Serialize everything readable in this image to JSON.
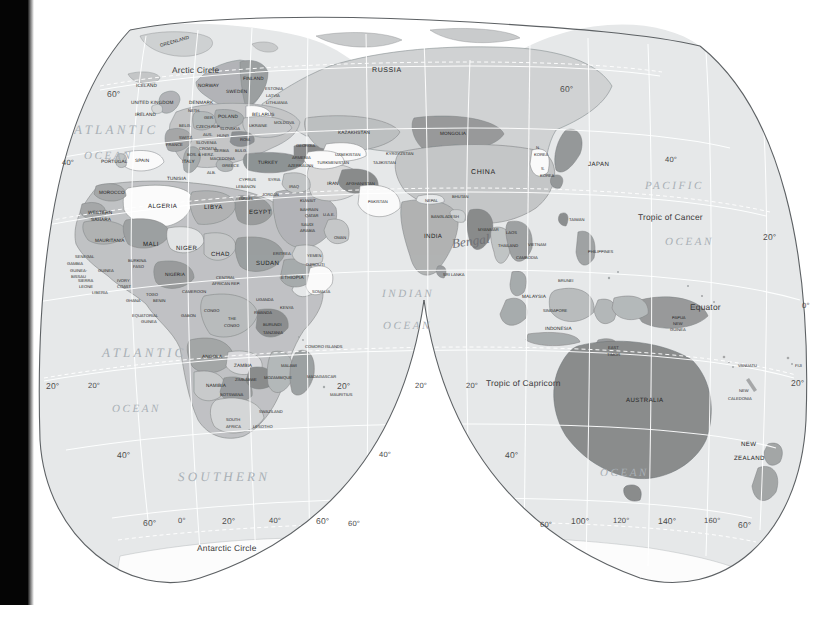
{
  "document": {
    "type": "world-map",
    "projection": "interrupted-goode-homolosine-lobes",
    "coverage": "Eastern Hemisphere: Europe, Africa, Asia, Australia, Oceania",
    "style": "greyscale political reference map"
  },
  "colors": {
    "background": "#ffffff",
    "ocean": "#e4e6e7",
    "land_light": "#d3d5d6",
    "land_mid": "#b6b9ba",
    "land_dark": "#9a9d9e",
    "land_darkest": "#808384",
    "land_white": "#fbfbfb",
    "graticule": "#ffffff",
    "outline": "#5d6164",
    "label": "#232323",
    "ocean_label": "#a9b0b6",
    "scan_edge": "#050505"
  },
  "oceans": [
    {
      "name": "ATLANTIC",
      "x": 74,
      "y": 122
    },
    {
      "name": "OCEAN",
      "x": 84,
      "y": 150
    },
    {
      "name": "ATLANTIC",
      "x": 102,
      "y": 345
    },
    {
      "name": "OCEAN",
      "x": 112,
      "y": 403
    },
    {
      "name": "SOUTHERN",
      "x": 178,
      "y": 469
    },
    {
      "name": "INDIAN",
      "x": 382,
      "y": 288
    },
    {
      "name": "OCEAN",
      "x": 383,
      "y": 320
    },
    {
      "name": "PACIFIC",
      "x": 645,
      "y": 180
    },
    {
      "name": "OCEAN",
      "x": 665,
      "y": 236
    },
    {
      "name": "OCEAN",
      "x": 600,
      "y": 467
    }
  ],
  "special_lines": [
    {
      "label": "Arctic Circle",
      "x": 172,
      "y": 65
    },
    {
      "label": "Antarctic Circle",
      "x": 197,
      "y": 543
    },
    {
      "label": "Tropic of Cancer",
      "x": 638,
      "y": 212
    },
    {
      "label": "Tropic of Capricorn",
      "x": 486,
      "y": 378
    },
    {
      "label": "Equator",
      "x": 690,
      "y": 302
    }
  ],
  "graticule_labels": [
    {
      "label": "60°",
      "x": 107,
      "y": 89
    },
    {
      "label": "40°",
      "x": 62,
      "y": 158
    },
    {
      "label": "20°",
      "x": 46,
      "y": 381
    },
    {
      "label": "20°",
      "x": 88,
      "y": 381
    },
    {
      "label": "40°",
      "x": 117,
      "y": 450
    },
    {
      "label": "40°",
      "x": 379,
      "y": 450
    },
    {
      "label": "60°",
      "x": 143,
      "y": 518
    },
    {
      "label": "0°",
      "x": 178,
      "y": 516
    },
    {
      "label": "20°",
      "x": 222,
      "y": 516
    },
    {
      "label": "40°",
      "x": 269,
      "y": 516
    },
    {
      "label": "60°",
      "x": 316,
      "y": 516
    },
    {
      "label": "60°",
      "x": 348,
      "y": 519
    },
    {
      "label": "20°",
      "x": 337,
      "y": 381
    },
    {
      "label": "20°",
      "x": 415,
      "y": 381
    },
    {
      "label": "60°",
      "x": 560,
      "y": 84
    },
    {
      "label": "40°",
      "x": 665,
      "y": 155
    },
    {
      "label": "20°",
      "x": 763,
      "y": 232
    },
    {
      "label": "0°",
      "x": 802,
      "y": 301
    },
    {
      "label": "20°",
      "x": 791,
      "y": 378
    },
    {
      "label": "20°",
      "x": 466,
      "y": 381
    },
    {
      "label": "40°",
      "x": 505,
      "y": 450
    },
    {
      "label": "60°",
      "x": 540,
      "y": 520
    },
    {
      "label": "100°",
      "x": 571,
      "y": 516
    },
    {
      "label": "120°",
      "x": 613,
      "y": 516
    },
    {
      "label": "140°",
      "x": 658,
      "y": 516
    },
    {
      "label": "160°",
      "x": 704,
      "y": 516
    },
    {
      "label": "60°",
      "x": 738,
      "y": 520
    }
  ],
  "annotation": {
    "text": "Bengal",
    "x": 452,
    "y": 236
  },
  "countries": [
    {
      "n": "GREENLAND",
      "x": 160,
      "y": 43,
      "s": "sm",
      "r": "rot-l2"
    },
    {
      "n": "ICELAND",
      "x": 136,
      "y": 83,
      "s": "sm"
    },
    {
      "n": "NORWAY",
      "x": 198,
      "y": 83,
      "s": "sm"
    },
    {
      "n": "SWEDEN",
      "x": 226,
      "y": 89,
      "s": "sm"
    },
    {
      "n": "FINLAND",
      "x": 243,
      "y": 76,
      "s": "sm"
    },
    {
      "n": "ESTONIA",
      "x": 265,
      "y": 86,
      "s": "tiny"
    },
    {
      "n": "LATVIA",
      "x": 266,
      "y": 93,
      "s": "tiny"
    },
    {
      "n": "LITHUANIA",
      "x": 266,
      "y": 100,
      "s": "tiny"
    },
    {
      "n": "UNITED KINGDOM",
      "x": 131,
      "y": 100,
      "s": "sm"
    },
    {
      "n": "DENMARK",
      "x": 189,
      "y": 100,
      "s": "sm"
    },
    {
      "n": "IRELAND",
      "x": 135,
      "y": 112,
      "s": "sm"
    },
    {
      "n": "NETH.",
      "x": 188,
      "y": 108,
      "s": "tiny"
    },
    {
      "n": "GER.",
      "x": 204,
      "y": 115,
      "s": "tiny"
    },
    {
      "n": "POLAND",
      "x": 218,
      "y": 114,
      "s": "sm"
    },
    {
      "n": "BELARUS",
      "x": 252,
      "y": 112,
      "s": "sm"
    },
    {
      "n": "MOLDOVA",
      "x": 274,
      "y": 120,
      "s": "tiny"
    },
    {
      "n": "UKRAINE",
      "x": 249,
      "y": 123,
      "s": "tiny"
    },
    {
      "n": "BELG.",
      "x": 179,
      "y": 123,
      "s": "tiny"
    },
    {
      "n": "CZECH REP.",
      "x": 196,
      "y": 124,
      "s": "tiny"
    },
    {
      "n": "SLOVAKIA",
      "x": 220,
      "y": 126,
      "s": "tiny"
    },
    {
      "n": "SWITZ.",
      "x": 179,
      "y": 135,
      "s": "tiny"
    },
    {
      "n": "AUS.",
      "x": 203,
      "y": 132,
      "s": "tiny"
    },
    {
      "n": "HUNG.",
      "x": 217,
      "y": 133,
      "s": "tiny"
    },
    {
      "n": "FRANCE",
      "x": 166,
      "y": 142,
      "s": "tiny"
    },
    {
      "n": "SLOVENIA",
      "x": 196,
      "y": 140,
      "s": "tiny"
    },
    {
      "n": "CROATIA",
      "x": 199,
      "y": 146,
      "s": "tiny"
    },
    {
      "n": "ROM.",
      "x": 240,
      "y": 137,
      "s": "tiny"
    },
    {
      "n": "BOS. & HERZ.",
      "x": 187,
      "y": 152,
      "s": "tiny"
    },
    {
      "n": "SERBIA",
      "x": 214,
      "y": 148,
      "s": "tiny"
    },
    {
      "n": "BULG.",
      "x": 235,
      "y": 148,
      "s": "tiny"
    },
    {
      "n": "GEORGIA",
      "x": 296,
      "y": 143,
      "s": "tiny"
    },
    {
      "n": "PORTUGAL",
      "x": 101,
      "y": 159,
      "s": "sm"
    },
    {
      "n": "SPAIN",
      "x": 135,
      "y": 158,
      "s": "sm"
    },
    {
      "n": "ITALY",
      "x": 182,
      "y": 159,
      "s": "sm"
    },
    {
      "n": "MACEDONIA",
      "x": 210,
      "y": 156,
      "s": "tiny"
    },
    {
      "n": "GREECE",
      "x": 222,
      "y": 163,
      "s": "tiny"
    },
    {
      "n": "TURKEY",
      "x": 258,
      "y": 160,
      "s": "sm"
    },
    {
      "n": "ARMENIA",
      "x": 292,
      "y": 155,
      "s": "tiny"
    },
    {
      "n": "AZERBAIJAN",
      "x": 288,
      "y": 163,
      "s": "tiny"
    },
    {
      "n": "ALB.",
      "x": 207,
      "y": 170,
      "s": "tiny"
    },
    {
      "n": "TUNISIA",
      "x": 167,
      "y": 176,
      "s": "sm"
    },
    {
      "n": "CYPRUS",
      "x": 239,
      "y": 177,
      "s": "tiny"
    },
    {
      "n": "LEBANON",
      "x": 236,
      "y": 184,
      "s": "tiny"
    },
    {
      "n": "SYRIA",
      "x": 268,
      "y": 177,
      "s": "tiny"
    },
    {
      "n": "IRAQ",
      "x": 289,
      "y": 184,
      "s": "tiny"
    },
    {
      "n": "ISRAEL",
      "x": 239,
      "y": 196,
      "s": "tiny"
    },
    {
      "n": "JORDAN",
      "x": 262,
      "y": 192,
      "s": "tiny"
    },
    {
      "n": "MOROCCO",
      "x": 99,
      "y": 190,
      "s": "sm"
    },
    {
      "n": "ALGERIA",
      "x": 148,
      "y": 203,
      "s": "med"
    },
    {
      "n": "LIBYA",
      "x": 204,
      "y": 204,
      "s": "med"
    },
    {
      "n": "EGYPT",
      "x": 249,
      "y": 209,
      "s": "med"
    },
    {
      "n": "KUWAIT",
      "x": 300,
      "y": 198,
      "s": "tiny"
    },
    {
      "n": "BAHRAIN",
      "x": 300,
      "y": 207,
      "s": "tiny"
    },
    {
      "n": "QATAR",
      "x": 305,
      "y": 213,
      "s": "tiny"
    },
    {
      "n": "U.A.E.",
      "x": 323,
      "y": 212,
      "s": "tiny"
    },
    {
      "n": "SAUDI",
      "x": 301,
      "y": 222,
      "s": "tiny"
    },
    {
      "n": "ARABIA",
      "x": 300,
      "y": 228,
      "s": "tiny"
    },
    {
      "n": "OMAN",
      "x": 334,
      "y": 235,
      "s": "tiny"
    },
    {
      "n": "WESTERN",
      "x": 88,
      "y": 210,
      "s": "sm"
    },
    {
      "n": "SAHARA",
      "x": 91,
      "y": 217,
      "s": "sm"
    },
    {
      "n": "MAURITANIA",
      "x": 95,
      "y": 238,
      "s": "sm"
    },
    {
      "n": "MALI",
      "x": 143,
      "y": 241,
      "s": "med"
    },
    {
      "n": "NIGER",
      "x": 176,
      "y": 245,
      "s": "med"
    },
    {
      "n": "CHAD",
      "x": 211,
      "y": 251,
      "s": "med"
    },
    {
      "n": "SUDAN",
      "x": 256,
      "y": 260,
      "s": "med"
    },
    {
      "n": "ERITREA",
      "x": 273,
      "y": 251,
      "s": "tiny"
    },
    {
      "n": "YEMEN",
      "x": 307,
      "y": 253,
      "s": "tiny"
    },
    {
      "n": "DJIBOUTI",
      "x": 306,
      "y": 262,
      "s": "tiny"
    },
    {
      "n": "SENEGAL",
      "x": 75,
      "y": 254,
      "s": "tiny"
    },
    {
      "n": "GAMBIA",
      "x": 67,
      "y": 261,
      "s": "tiny"
    },
    {
      "n": "GUINEA-",
      "x": 70,
      "y": 268,
      "s": "tiny"
    },
    {
      "n": "BISSAU",
      "x": 71,
      "y": 274,
      "s": "tiny"
    },
    {
      "n": "GUINEA",
      "x": 98,
      "y": 268,
      "s": "tiny"
    },
    {
      "n": "BURKINA",
      "x": 128,
      "y": 258,
      "s": "tiny"
    },
    {
      "n": "FASO",
      "x": 133,
      "y": 264,
      "s": "tiny"
    },
    {
      "n": "SIERRA",
      "x": 78,
      "y": 278,
      "s": "tiny"
    },
    {
      "n": "LEONE",
      "x": 79,
      "y": 284,
      "s": "tiny"
    },
    {
      "n": "LIBERIA",
      "x": 92,
      "y": 290,
      "s": "tiny"
    },
    {
      "n": "IVORY",
      "x": 117,
      "y": 278,
      "s": "tiny"
    },
    {
      "n": "COAST",
      "x": 117,
      "y": 284,
      "s": "tiny"
    },
    {
      "n": "GHANA",
      "x": 126,
      "y": 298,
      "s": "tiny"
    },
    {
      "n": "TOGO",
      "x": 146,
      "y": 292,
      "s": "tiny"
    },
    {
      "n": "BENIN",
      "x": 153,
      "y": 298,
      "s": "tiny"
    },
    {
      "n": "NIGERIA",
      "x": 165,
      "y": 272,
      "s": "sm"
    },
    {
      "n": "CAMEROON",
      "x": 182,
      "y": 289,
      "s": "tiny"
    },
    {
      "n": "CENTRAL",
      "x": 216,
      "y": 275,
      "s": "tiny"
    },
    {
      "n": "AFRICAN REP.",
      "x": 212,
      "y": 281,
      "s": "tiny"
    },
    {
      "n": "ETHIOPIA",
      "x": 281,
      "y": 275,
      "s": "sm"
    },
    {
      "n": "SOMALIA",
      "x": 312,
      "y": 289,
      "s": "tiny"
    },
    {
      "n": "EQUATORIAL",
      "x": 132,
      "y": 313,
      "s": "tiny"
    },
    {
      "n": "GUINEA",
      "x": 141,
      "y": 319,
      "s": "tiny"
    },
    {
      "n": "GABON",
      "x": 181,
      "y": 313,
      "s": "tiny"
    },
    {
      "n": "CONGO",
      "x": 204,
      "y": 308,
      "s": "tiny"
    },
    {
      "n": "THE",
      "x": 228,
      "y": 316,
      "s": "tiny"
    },
    {
      "n": "CONGO",
      "x": 224,
      "y": 323,
      "s": "tiny"
    },
    {
      "n": "UGANDA",
      "x": 256,
      "y": 297,
      "s": "tiny"
    },
    {
      "n": "KENYA",
      "x": 280,
      "y": 305,
      "s": "tiny"
    },
    {
      "n": "RWANDA",
      "x": 254,
      "y": 310,
      "s": "tiny"
    },
    {
      "n": "BURUNDI",
      "x": 263,
      "y": 322,
      "s": "tiny"
    },
    {
      "n": "TANZANIA",
      "x": 263,
      "y": 330,
      "s": "tiny"
    },
    {
      "n": "COMORO ISLANDS",
      "x": 305,
      "y": 344,
      "s": "tiny"
    },
    {
      "n": "ANGOLA",
      "x": 202,
      "y": 354,
      "s": "sm"
    },
    {
      "n": "ZAMBIA",
      "x": 234,
      "y": 363,
      "s": "sm"
    },
    {
      "n": "MALAWI",
      "x": 281,
      "y": 363,
      "s": "tiny"
    },
    {
      "n": "MOZAMBIQUE",
      "x": 264,
      "y": 375,
      "s": "tiny"
    },
    {
      "n": "MADAGASCAR",
      "x": 307,
      "y": 374,
      "s": "tiny"
    },
    {
      "n": "NAMIBIA",
      "x": 206,
      "y": 383,
      "s": "sm"
    },
    {
      "n": "ZIMBABWE",
      "x": 235,
      "y": 377,
      "s": "tiny"
    },
    {
      "n": "BOTSWANA",
      "x": 220,
      "y": 392,
      "s": "tiny"
    },
    {
      "n": "MAURITIUS",
      "x": 330,
      "y": 392,
      "s": "tiny"
    },
    {
      "n": "SWAZILAND",
      "x": 259,
      "y": 409,
      "s": "tiny"
    },
    {
      "n": "SOUTH",
      "x": 226,
      "y": 417,
      "s": "tiny"
    },
    {
      "n": "AFRICA",
      "x": 226,
      "y": 424,
      "s": "tiny"
    },
    {
      "n": "LESOTHO",
      "x": 253,
      "y": 424,
      "s": "tiny"
    },
    {
      "n": "RUSSIA",
      "x": 372,
      "y": 67,
      "s": "big"
    },
    {
      "n": "KAZAKHSTAN",
      "x": 338,
      "y": 130,
      "s": "sm"
    },
    {
      "n": "MONGOLIA",
      "x": 440,
      "y": 131,
      "s": "sm"
    },
    {
      "n": "UZBEKISTAN",
      "x": 335,
      "y": 152,
      "s": "tiny"
    },
    {
      "n": "KYRGYZSTAN",
      "x": 386,
      "y": 151,
      "s": "tiny"
    },
    {
      "n": "TURKMENISTAN",
      "x": 317,
      "y": 160,
      "s": "tiny"
    },
    {
      "n": "TAJIKISTAN",
      "x": 373,
      "y": 160,
      "s": "tiny"
    },
    {
      "n": "CHINA",
      "x": 471,
      "y": 169,
      "s": "big"
    },
    {
      "n": "IRAN",
      "x": 327,
      "y": 181,
      "s": "sm"
    },
    {
      "n": "AFGHANISTAN",
      "x": 346,
      "y": 181,
      "s": "tiny"
    },
    {
      "n": "PAKISTAN",
      "x": 368,
      "y": 199,
      "s": "tiny"
    },
    {
      "n": "N.",
      "x": 536,
      "y": 145,
      "s": "tiny"
    },
    {
      "n": "KOREA",
      "x": 534,
      "y": 152,
      "s": "tiny"
    },
    {
      "n": "S.",
      "x": 541,
      "y": 166,
      "s": "tiny"
    },
    {
      "n": "KOREA",
      "x": 540,
      "y": 173,
      "s": "tiny"
    },
    {
      "n": "JAPAN",
      "x": 588,
      "y": 161,
      "s": "med"
    },
    {
      "n": "NEPAL",
      "x": 425,
      "y": 198,
      "s": "tiny"
    },
    {
      "n": "BHUTAN",
      "x": 452,
      "y": 194,
      "s": "tiny"
    },
    {
      "n": "BANGLADESH",
      "x": 431,
      "y": 214,
      "s": "tiny"
    },
    {
      "n": "INDIA",
      "x": 424,
      "y": 233,
      "s": "med"
    },
    {
      "n": "MYANMAR",
      "x": 478,
      "y": 227,
      "s": "tiny"
    },
    {
      "n": "LAOS",
      "x": 506,
      "y": 230,
      "s": "tiny"
    },
    {
      "n": "THAILAND",
      "x": 498,
      "y": 243,
      "s": "tiny"
    },
    {
      "n": "VIETNAM",
      "x": 528,
      "y": 242,
      "s": "tiny"
    },
    {
      "n": "CAMBODIA",
      "x": 516,
      "y": 255,
      "s": "tiny"
    },
    {
      "n": "TAIWAN",
      "x": 569,
      "y": 217,
      "s": "tiny"
    },
    {
      "n": "PHILIPPINES",
      "x": 588,
      "y": 249,
      "s": "tiny"
    },
    {
      "n": "SRI LANKA",
      "x": 443,
      "y": 272,
      "s": "tiny"
    },
    {
      "n": "BRUNEI",
      "x": 558,
      "y": 278,
      "s": "tiny"
    },
    {
      "n": "MALAYSIA",
      "x": 522,
      "y": 294,
      "s": "sm"
    },
    {
      "n": "SINGAPORE",
      "x": 543,
      "y": 308,
      "s": "tiny"
    },
    {
      "n": "INDONESIA",
      "x": 545,
      "y": 326,
      "s": "sm"
    },
    {
      "n": "PAPUA",
      "x": 672,
      "y": 315,
      "s": "tiny"
    },
    {
      "n": "NEW",
      "x": 673,
      "y": 321,
      "s": "tiny"
    },
    {
      "n": "GUINEA",
      "x": 670,
      "y": 327,
      "s": "tiny"
    },
    {
      "n": "EAST",
      "x": 608,
      "y": 345,
      "s": "tiny"
    },
    {
      "n": "TIMOR",
      "x": 607,
      "y": 352,
      "s": "tiny"
    },
    {
      "n": "VANUATU",
      "x": 738,
      "y": 363,
      "s": "tiny"
    },
    {
      "n": "FIJI",
      "x": 795,
      "y": 363,
      "s": "tiny"
    },
    {
      "n": "AUSTRALIA",
      "x": 626,
      "y": 397,
      "s": "med"
    },
    {
      "n": "NEW",
      "x": 739,
      "y": 388,
      "s": "tiny"
    },
    {
      "n": "CALEDONIA",
      "x": 728,
      "y": 396,
      "s": "tiny"
    },
    {
      "n": "NEW",
      "x": 741,
      "y": 441,
      "s": "med"
    },
    {
      "n": "ZEALAND",
      "x": 734,
      "y": 455,
      "s": "med"
    }
  ]
}
